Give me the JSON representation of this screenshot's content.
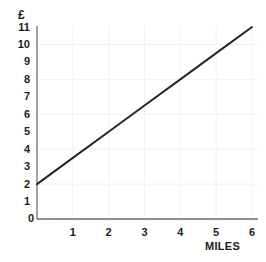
{
  "chart_data": {
    "type": "line",
    "title": "",
    "subtitle": "",
    "xlabel": "MILES",
    "ylabel": "£",
    "xlim": [
      0,
      6
    ],
    "ylim": [
      0,
      11
    ],
    "grid": true,
    "legend": null,
    "x_ticks": [
      "1",
      "2",
      "3",
      "4",
      "5",
      "6"
    ],
    "x_tick_values": [
      1,
      2,
      3,
      4,
      5,
      6
    ],
    "y_ticks": [
      "1",
      "2",
      "3",
      "4",
      "5",
      "6",
      "7",
      "8",
      "9",
      "10",
      "11"
    ],
    "y_tick_values": [
      1,
      2,
      3,
      4,
      5,
      6,
      7,
      8,
      9,
      10,
      11
    ],
    "origin_label": "0",
    "series": [
      {
        "name": "fare",
        "color": "#262626",
        "x": [
          0,
          1,
          2,
          3,
          4,
          5,
          6
        ],
        "values": [
          2,
          3.5,
          5,
          6.5,
          8,
          9.5,
          11
        ]
      }
    ]
  },
  "axes": {
    "y_title": "£",
    "x_title": "MILES",
    "origin": "0"
  },
  "style": {
    "line_color": "#262626",
    "axis_color": "#6f6f6f",
    "grid_color": "#eef1f5",
    "background": "#ffffff",
    "text_color": "#1c1c1c"
  }
}
